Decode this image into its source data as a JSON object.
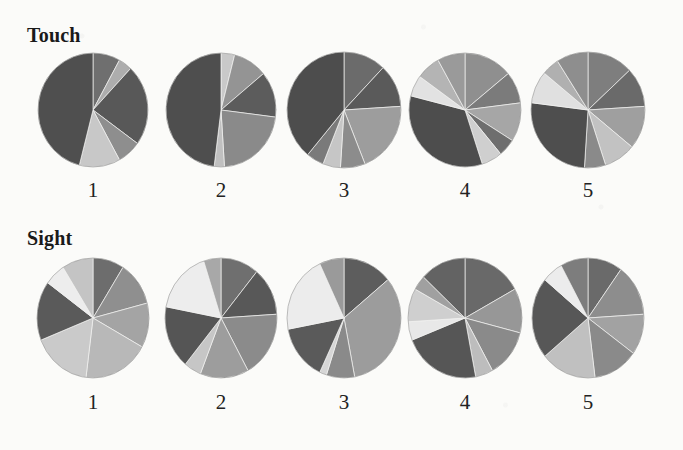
{
  "figure": {
    "background_color": "#fbfbf9",
    "rows": [
      {
        "label": "Touch",
        "label_x": 27,
        "label_y": 24,
        "pie_center_y": 110,
        "number_y": 178,
        "pies": [
          {
            "number": "1",
            "cx": 93,
            "rx": 55,
            "ry": 57,
            "rotation": 0,
            "slices": [
              {
                "label": "slice-1",
                "value": 8,
                "color": "#6f6f6f"
              },
              {
                "label": "slice-2",
                "value": 4,
                "color": "#adadad"
              },
              {
                "label": "slice-3",
                "value": 23,
                "color": "#585858"
              },
              {
                "label": "slice-4",
                "value": 7,
                "color": "#8e8e8e"
              },
              {
                "label": "slice-5",
                "value": 12,
                "color": "#c8c8c8"
              },
              {
                "label": "slice-6",
                "value": 46,
                "color": "#4f4f4f"
              }
            ]
          },
          {
            "number": "2",
            "cx": 221,
            "rx": 55,
            "ry": 57,
            "rotation": 0,
            "slices": [
              {
                "label": "slice-1",
                "value": 4,
                "color": "#c9c9c9"
              },
              {
                "label": "slice-2",
                "value": 10,
                "color": "#949494"
              },
              {
                "label": "slice-3",
                "value": 13,
                "color": "#5c5c5c"
              },
              {
                "label": "slice-4",
                "value": 22,
                "color": "#8a8a8a"
              },
              {
                "label": "slice-5",
                "value": 3,
                "color": "#c0c0c0"
              },
              {
                "label": "slice-6",
                "value": 48,
                "color": "#4e4e4e"
              }
            ]
          },
          {
            "number": "3",
            "cx": 344,
            "rx": 57,
            "ry": 58,
            "rotation": 0,
            "slices": [
              {
                "label": "slice-1",
                "value": 12,
                "color": "#6b6b6b"
              },
              {
                "label": "slice-2",
                "value": 12,
                "color": "#5a5a5a"
              },
              {
                "label": "slice-3",
                "value": 20,
                "color": "#9d9d9d"
              },
              {
                "label": "slice-4",
                "value": 7,
                "color": "#8c8c8c"
              },
              {
                "label": "slice-5",
                "value": 5,
                "color": "#c6c6c6"
              },
              {
                "label": "slice-6",
                "value": 5,
                "color": "#7a7a7a"
              },
              {
                "label": "slice-7",
                "value": 39,
                "color": "#4d4d4d"
              }
            ]
          },
          {
            "number": "4",
            "cx": 465,
            "rx": 56,
            "ry": 57,
            "rotation": 0,
            "slices": [
              {
                "label": "slice-1",
                "value": 14,
                "color": "#8f8f8f"
              },
              {
                "label": "slice-2",
                "value": 9,
                "color": "#7b7b7b"
              },
              {
                "label": "slice-3",
                "value": 11,
                "color": "#a6a6a6"
              },
              {
                "label": "slice-4",
                "value": 5,
                "color": "#6e6e6e"
              },
              {
                "label": "slice-5",
                "value": 6,
                "color": "#cfcfcf"
              },
              {
                "label": "slice-6",
                "value": 34,
                "color": "#4d4d4d"
              },
              {
                "label": "slice-7",
                "value": 6,
                "color": "#e2e2e2"
              },
              {
                "label": "slice-8",
                "value": 7,
                "color": "#b4b4b4"
              },
              {
                "label": "slice-9",
                "value": 8,
                "color": "#9a9a9a"
              }
            ]
          },
          {
            "number": "5",
            "cx": 588,
            "rx": 57,
            "ry": 58,
            "rotation": 0,
            "slices": [
              {
                "label": "slice-1",
                "value": 13,
                "color": "#7e7e7e"
              },
              {
                "label": "slice-2",
                "value": 11,
                "color": "#6a6a6a"
              },
              {
                "label": "slice-3",
                "value": 12,
                "color": "#9f9f9f"
              },
              {
                "label": "slice-4",
                "value": 9,
                "color": "#c2c2c2"
              },
              {
                "label": "slice-5",
                "value": 6,
                "color": "#8a8a8a"
              },
              {
                "label": "slice-6",
                "value": 26,
                "color": "#4e4e4e"
              },
              {
                "label": "slice-7",
                "value": 9,
                "color": "#e0e0e0"
              },
              {
                "label": "slice-8",
                "value": 5,
                "color": "#b0b0b0"
              },
              {
                "label": "slice-9",
                "value": 9,
                "color": "#8e8e8e"
              }
            ]
          }
        ]
      },
      {
        "label": "Sight",
        "label_x": 27,
        "label_y": 227,
        "pie_center_y": 318,
        "number_y": 390,
        "pies": [
          {
            "number": "1",
            "cx": 93,
            "rx": 56,
            "ry": 60,
            "rotation": 0,
            "slices": [
              {
                "label": "slice-1",
                "value": 9,
                "color": "#6d6d6d"
              },
              {
                "label": "slice-2",
                "value": 12,
                "color": "#8f8f8f"
              },
              {
                "label": "slice-3",
                "value": 12,
                "color": "#a4a4a4"
              },
              {
                "label": "slice-4",
                "value": 19,
                "color": "#b8b8b8"
              },
              {
                "label": "slice-5",
                "value": 17,
                "color": "#cacaca"
              },
              {
                "label": "slice-6",
                "value": 16,
                "color": "#5a5a5a"
              },
              {
                "label": "slice-7",
                "value": 6,
                "color": "#ededed"
              },
              {
                "label": "slice-8",
                "value": 9,
                "color": "#c4c4c4"
              }
            ]
          },
          {
            "number": "2",
            "cx": 221,
            "rx": 56,
            "ry": 60,
            "rotation": 0,
            "slices": [
              {
                "label": "slice-1",
                "value": 11,
                "color": "#6f6f6f"
              },
              {
                "label": "slice-2",
                "value": 13,
                "color": "#585858"
              },
              {
                "label": "slice-3",
                "value": 18,
                "color": "#8b8b8b"
              },
              {
                "label": "slice-4",
                "value": 14,
                "color": "#9d9d9d"
              },
              {
                "label": "slice-5",
                "value": 5,
                "color": "#c6c6c6"
              },
              {
                "label": "slice-6",
                "value": 17,
                "color": "#555555"
              },
              {
                "label": "slice-7",
                "value": 17,
                "color": "#ededed"
              },
              {
                "label": "slice-8",
                "value": 5,
                "color": "#a8a8a8"
              }
            ]
          },
          {
            "number": "3",
            "cx": 344,
            "rx": 57,
            "ry": 60,
            "rotation": 0,
            "slices": [
              {
                "label": "slice-1",
                "value": 14,
                "color": "#5d5d5d"
              },
              {
                "label": "slice-2",
                "value": 33,
                "color": "#9c9c9c"
              },
              {
                "label": "slice-3",
                "value": 8,
                "color": "#8a8a8a"
              },
              {
                "label": "slice-4",
                "value": 2,
                "color": "#d6d6d6"
              },
              {
                "label": "slice-5",
                "value": 15,
                "color": "#5a5a5a"
              },
              {
                "label": "slice-6",
                "value": 21,
                "color": "#ececec"
              },
              {
                "label": "slice-7",
                "value": 7,
                "color": "#9a9a9a"
              }
            ]
          },
          {
            "number": "4",
            "cx": 465,
            "rx": 57,
            "ry": 60,
            "rotation": 0,
            "slices": [
              {
                "label": "slice-1",
                "value": 17,
                "color": "#696969"
              },
              {
                "label": "slice-2",
                "value": 12,
                "color": "#979797"
              },
              {
                "label": "slice-3",
                "value": 13,
                "color": "#8a8a8a"
              },
              {
                "label": "slice-4",
                "value": 5,
                "color": "#bdbdbd"
              },
              {
                "label": "slice-5",
                "value": 22,
                "color": "#565656"
              },
              {
                "label": "slice-6",
                "value": 5,
                "color": "#e8e8e8"
              },
              {
                "label": "slice-7",
                "value": 9,
                "color": "#cfcfcf"
              },
              {
                "label": "slice-8",
                "value": 4,
                "color": "#a0a0a0"
              },
              {
                "label": "slice-9",
                "value": 13,
                "color": "#636363"
              }
            ]
          },
          {
            "number": "5",
            "cx": 588,
            "rx": 56,
            "ry": 60,
            "rotation": 0,
            "slices": [
              {
                "label": "slice-1",
                "value": 10,
                "color": "#6a6a6a"
              },
              {
                "label": "slice-2",
                "value": 14,
                "color": "#8d8d8d"
              },
              {
                "label": "slice-3",
                "value": 11,
                "color": "#a2a2a2"
              },
              {
                "label": "slice-4",
                "value": 13,
                "color": "#8a8a8a"
              },
              {
                "label": "slice-5",
                "value": 16,
                "color": "#c0c0c0"
              },
              {
                "label": "slice-6",
                "value": 22,
                "color": "#575757"
              },
              {
                "label": "slice-7",
                "value": 6,
                "color": "#ececec"
              },
              {
                "label": "slice-8",
                "value": 8,
                "color": "#7d7d7d"
              }
            ]
          }
        ]
      }
    ]
  },
  "chart_data": {
    "type": "pie",
    "title": "",
    "grid": false,
    "legend": "none",
    "panel_rows": [
      "Touch",
      "Sight"
    ],
    "panel_columns": [
      "1",
      "2",
      "3",
      "4",
      "5"
    ],
    "units": "percent",
    "panels": [
      {
        "row": "Touch",
        "column": "1",
        "slice_labels": [
          "slice-1",
          "slice-2",
          "slice-3",
          "slice-4",
          "slice-5",
          "slice-6"
        ],
        "values": [
          8,
          4,
          23,
          7,
          12,
          46
        ],
        "colors": [
          "#6f6f6f",
          "#adadad",
          "#585858",
          "#8e8e8e",
          "#c8c8c8",
          "#4f4f4f"
        ]
      },
      {
        "row": "Touch",
        "column": "2",
        "slice_labels": [
          "slice-1",
          "slice-2",
          "slice-3",
          "slice-4",
          "slice-5",
          "slice-6"
        ],
        "values": [
          4,
          10,
          13,
          22,
          3,
          48
        ],
        "colors": [
          "#c9c9c9",
          "#949494",
          "#5c5c5c",
          "#8a8a8a",
          "#c0c0c0",
          "#4e4e4e"
        ]
      },
      {
        "row": "Touch",
        "column": "3",
        "slice_labels": [
          "slice-1",
          "slice-2",
          "slice-3",
          "slice-4",
          "slice-5",
          "slice-6",
          "slice-7"
        ],
        "values": [
          12,
          12,
          20,
          7,
          5,
          5,
          39
        ],
        "colors": [
          "#6b6b6b",
          "#5a5a5a",
          "#9d9d9d",
          "#8c8c8c",
          "#c6c6c6",
          "#7a7a7a",
          "#4d4d4d"
        ]
      },
      {
        "row": "Touch",
        "column": "4",
        "slice_labels": [
          "slice-1",
          "slice-2",
          "slice-3",
          "slice-4",
          "slice-5",
          "slice-6",
          "slice-7",
          "slice-8",
          "slice-9"
        ],
        "values": [
          14,
          9,
          11,
          5,
          6,
          34,
          6,
          7,
          8
        ],
        "colors": [
          "#8f8f8f",
          "#7b7b7b",
          "#a6a6a6",
          "#6e6e6e",
          "#cfcfcf",
          "#4d4d4d",
          "#e2e2e2",
          "#b4b4b4",
          "#9a9a9a"
        ]
      },
      {
        "row": "Touch",
        "column": "5",
        "slice_labels": [
          "slice-1",
          "slice-2",
          "slice-3",
          "slice-4",
          "slice-5",
          "slice-6",
          "slice-7",
          "slice-8",
          "slice-9"
        ],
        "values": [
          13,
          11,
          12,
          9,
          6,
          26,
          9,
          5,
          9
        ],
        "colors": [
          "#7e7e7e",
          "#6a6a6a",
          "#9f9f9f",
          "#c2c2c2",
          "#8a8a8a",
          "#4e4e4e",
          "#e0e0e0",
          "#b0b0b0",
          "#8e8e8e"
        ]
      },
      {
        "row": "Sight",
        "column": "1",
        "slice_labels": [
          "slice-1",
          "slice-2",
          "slice-3",
          "slice-4",
          "slice-5",
          "slice-6",
          "slice-7",
          "slice-8"
        ],
        "values": [
          9,
          12,
          12,
          19,
          17,
          16,
          6,
          9
        ],
        "colors": [
          "#6d6d6d",
          "#8f8f8f",
          "#a4a4a4",
          "#b8b8b8",
          "#cacaca",
          "#5a5a5a",
          "#ededed",
          "#c4c4c4"
        ]
      },
      {
        "row": "Sight",
        "column": "2",
        "slice_labels": [
          "slice-1",
          "slice-2",
          "slice-3",
          "slice-4",
          "slice-5",
          "slice-6",
          "slice-7",
          "slice-8"
        ],
        "values": [
          11,
          13,
          18,
          14,
          5,
          17,
          17,
          5
        ],
        "colors": [
          "#6f6f6f",
          "#585858",
          "#8b8b8b",
          "#9d9d9d",
          "#c6c6c6",
          "#555555",
          "#ededed",
          "#a8a8a8"
        ]
      },
      {
        "row": "Sight",
        "column": "3",
        "slice_labels": [
          "slice-1",
          "slice-2",
          "slice-3",
          "slice-4",
          "slice-5",
          "slice-6",
          "slice-7"
        ],
        "values": [
          14,
          33,
          8,
          2,
          15,
          21,
          7
        ],
        "colors": [
          "#5d5d5d",
          "#9c9c9c",
          "#8a8a8a",
          "#d6d6d6",
          "#5a5a5a",
          "#ececec",
          "#9a9a9a"
        ]
      },
      {
        "row": "Sight",
        "column": "4",
        "slice_labels": [
          "slice-1",
          "slice-2",
          "slice-3",
          "slice-4",
          "slice-5",
          "slice-6",
          "slice-7",
          "slice-8",
          "slice-9"
        ],
        "values": [
          17,
          12,
          13,
          5,
          22,
          5,
          9,
          4,
          13
        ],
        "colors": [
          "#696969",
          "#979797",
          "#8a8a8a",
          "#bdbdbd",
          "#565656",
          "#e8e8e8",
          "#cfcfcf",
          "#a0a0a0",
          "#636363"
        ]
      },
      {
        "row": "Sight",
        "column": "5",
        "slice_labels": [
          "slice-1",
          "slice-2",
          "slice-3",
          "slice-4",
          "slice-5",
          "slice-6",
          "slice-7",
          "slice-8"
        ],
        "values": [
          10,
          14,
          11,
          13,
          16,
          22,
          6,
          8
        ],
        "colors": [
          "#6a6a6a",
          "#8d8d8d",
          "#a2a2a2",
          "#8a8a8a",
          "#c0c0c0",
          "#575757",
          "#ececec",
          "#7d7d7d"
        ]
      }
    ]
  }
}
